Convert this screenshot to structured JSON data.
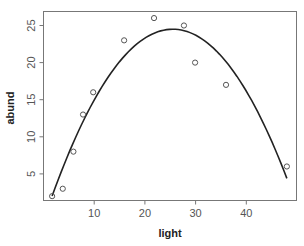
{
  "chart_data": {
    "type": "scatter",
    "title": "",
    "xlabel": "light",
    "ylabel": "abund",
    "xlim": [
      0.5,
      49.7
    ],
    "ylim": [
      1.2,
      26.9
    ],
    "x_ticks": [
      10,
      20,
      30,
      40
    ],
    "y_ticks": [
      5,
      10,
      15,
      20,
      25
    ],
    "grid": false,
    "legend": null,
    "series": [
      {
        "name": "observations",
        "kind": "points",
        "marker": "open-circle",
        "x": [
          1.7,
          3.8,
          5.9,
          7.8,
          9.8,
          15.9,
          21.8,
          27.7,
          29.9,
          36.0,
          48.0
        ],
        "y": [
          2,
          3,
          8,
          13,
          16,
          23,
          26,
          25,
          20,
          17,
          6
        ]
      },
      {
        "name": "quadratic fit",
        "kind": "line",
        "color": "#222222",
        "equation": "abund = 24.5 - 0.0397*(light - 25.5)^2",
        "x_range": [
          1.7,
          48.0
        ]
      }
    ]
  }
}
